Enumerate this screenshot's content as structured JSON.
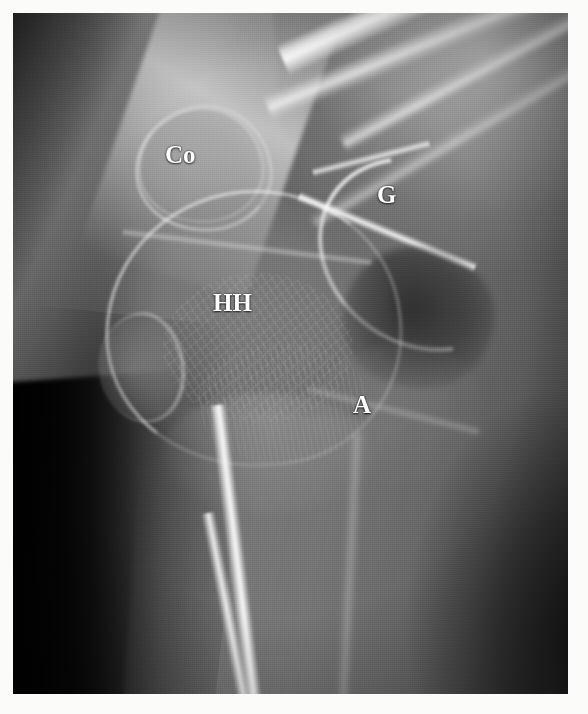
{
  "image": {
    "kind": "radiograph",
    "modality": "X-ray",
    "body_region": "shoulder",
    "view": "scapular-Y / transscapular lateral",
    "border_color": "#ffffff",
    "film_background_color": "#0a0a0a"
  },
  "annotations": {
    "label_color": "#ffffff",
    "items": [
      {
        "id": "co",
        "text": "Co",
        "meaning": "coracoid process",
        "x": 152,
        "y": 129
      },
      {
        "id": "g",
        "text": "G",
        "meaning": "glenoid",
        "x": 364,
        "y": 169
      },
      {
        "id": "hh",
        "text": "HH",
        "meaning": "humeral head",
        "x": 200,
        "y": 277
      },
      {
        "id": "a",
        "text": "A",
        "meaning": "acromion",
        "x": 340,
        "y": 379
      }
    ]
  },
  "structures": [
    {
      "name": "coracoid-process"
    },
    {
      "name": "glenoid"
    },
    {
      "name": "humeral-head"
    },
    {
      "name": "acromion"
    },
    {
      "name": "clavicle"
    },
    {
      "name": "scapular-body"
    },
    {
      "name": "humeral-shaft"
    },
    {
      "name": "greater-tuberosity"
    },
    {
      "name": "ribs"
    }
  ]
}
